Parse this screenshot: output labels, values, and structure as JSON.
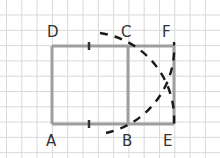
{
  "diagram": {
    "colors": {
      "background": "#ffffff",
      "grid": "#d9d9d9",
      "rectangle": "#9e9e9e",
      "arcs": "#1a1a1a",
      "labels": "#333333"
    },
    "grid": {
      "spacing": 15.3,
      "origin_x": 6.5,
      "origin_y": 15
    },
    "points": {
      "A": {
        "label": "A",
        "x": 52,
        "y": 124
      },
      "B": {
        "label": "B",
        "x": 128,
        "y": 124
      },
      "C": {
        "label": "C",
        "x": 128,
        "y": 46
      },
      "D": {
        "label": "D",
        "x": 52,
        "y": 46
      },
      "E": {
        "label": "E",
        "x": 174,
        "y": 124
      },
      "F": {
        "label": "F",
        "x": 174,
        "y": 46
      }
    },
    "midpoint_ticks": [
      "midpoint of DC",
      "midpoint of AB"
    ]
  }
}
